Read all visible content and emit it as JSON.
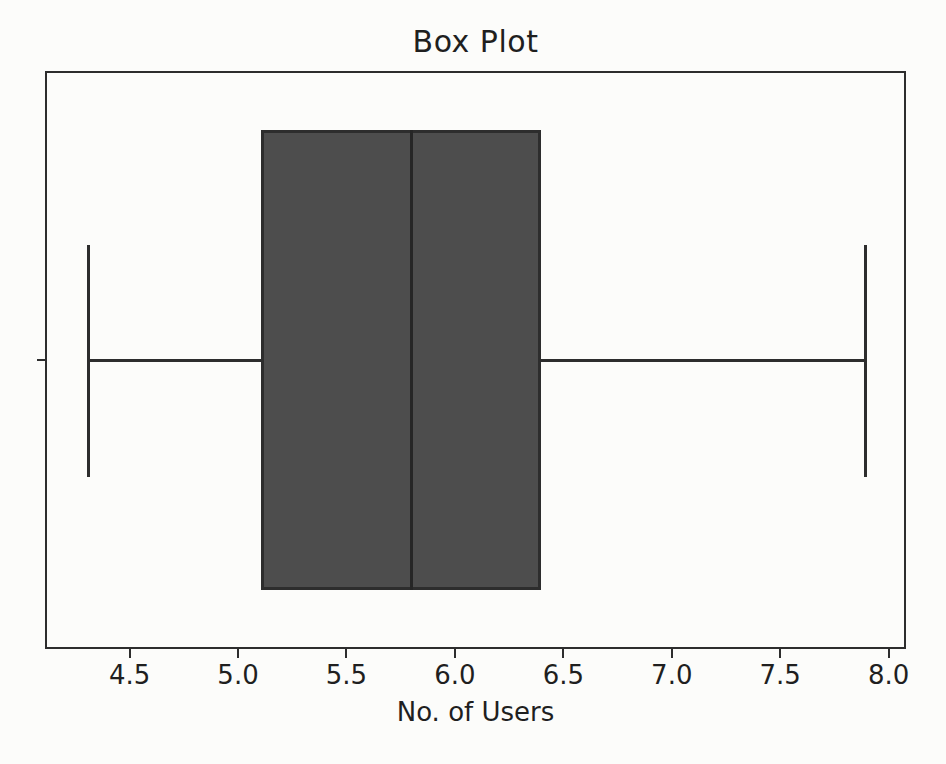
{
  "chart_data": {
    "type": "boxplot",
    "orientation": "horizontal",
    "title": "Box Plot",
    "xlabel": "No. of Users",
    "ylabel": "",
    "xlim": [
      4.11,
      8.08
    ],
    "xtick_values": [
      4.5,
      5.0,
      5.5,
      6.0,
      6.5,
      7.0,
      7.5,
      8.0
    ],
    "xticks": [
      "4.5",
      "5.0",
      "5.5",
      "6.0",
      "6.5",
      "7.0",
      "7.5",
      "8.0"
    ],
    "grid": false,
    "legend": "none",
    "series": [
      {
        "name": "No. of Users",
        "min": 4.3,
        "q1": 5.1,
        "median": 5.8,
        "q3": 6.4,
        "max": 7.9,
        "outliers": []
      }
    ],
    "colors": {
      "box_fill": "#4d4d4d",
      "line": "#2d2d2d",
      "median_line": "#262626",
      "background": "#fcfcfa",
      "text": "#1f1f1f"
    }
  }
}
